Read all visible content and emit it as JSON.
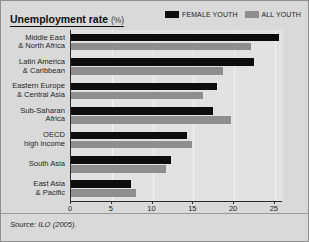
{
  "header": {
    "title": "Unemployment rate",
    "unit": "(%)"
  },
  "legend": {
    "position": "top-right",
    "items": [
      {
        "label": "FEMALE YOUTH",
        "color": "#0d0d0d",
        "swatch_name": "legend-swatch-female-youth"
      },
      {
        "label": "ALL YOUTH",
        "color": "#8e8e8e",
        "swatch_name": "legend-swatch-all-youth"
      }
    ]
  },
  "source": "Source: ILO (2005).",
  "chart_data": {
    "type": "bar",
    "orientation": "horizontal",
    "title": "Unemployment rate (%)",
    "xlabel": "",
    "ylabel": "",
    "xlim": [
      0,
      26
    ],
    "xticks": [
      0,
      5,
      10,
      15,
      20,
      25
    ],
    "xtick_labels": [
      "0",
      "5",
      "10",
      "15",
      "20",
      "25"
    ],
    "grid": true,
    "categories": [
      "Middle East & North Africa",
      "Latin America & Caribbean",
      "Eastern Europe & Central Asia",
      "Sub-Saharan Africa",
      "OECD high income",
      "South Asia",
      "East Asia & Pacific"
    ],
    "category_lines": [
      [
        "Middle East",
        "& North Africa"
      ],
      [
        "Latin America",
        "& Caribbean"
      ],
      [
        "Eastern Europe",
        "& Central Asia"
      ],
      [
        "Sub-Saharan",
        "Africa"
      ],
      [
        "OECD",
        "high income"
      ],
      [
        "South Asia"
      ],
      [
        "East Asia",
        "& Pacific"
      ]
    ],
    "series": [
      {
        "name": "FEMALE YOUTH",
        "color": "#0d0d0d",
        "values": [
          25.5,
          22.4,
          17.9,
          17.4,
          14.2,
          12.3,
          7.3
        ]
      },
      {
        "name": "ALL YOUTH",
        "color": "#8e8e8e",
        "values": [
          22.1,
          18.6,
          16.2,
          19.6,
          14.8,
          11.6,
          8.0
        ]
      }
    ]
  }
}
